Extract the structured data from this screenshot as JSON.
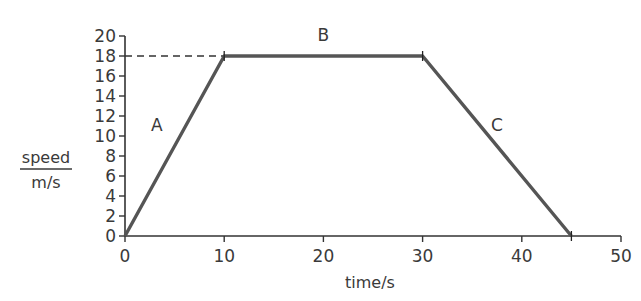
{
  "chart_data": {
    "type": "line",
    "title": "",
    "xlabel": "time/s",
    "ylabel_numerator": "speed",
    "ylabel_denominator": "m/s",
    "xlim": [
      0,
      50
    ],
    "ylim": [
      0,
      20
    ],
    "x_ticks": [
      "0",
      "10",
      "20",
      "30",
      "40",
      "50"
    ],
    "y_ticks": [
      "0",
      "2",
      "4",
      "6",
      "8",
      "10",
      "12",
      "14",
      "16",
      "18",
      "20"
    ],
    "grid": false,
    "series": [
      {
        "name": "speed",
        "x": [
          0,
          10,
          30,
          45
        ],
        "y": [
          0,
          18,
          18,
          0
        ],
        "color": "#555555"
      }
    ],
    "segment_labels": [
      {
        "label": "A",
        "x": 3.2,
        "y": 10.5
      },
      {
        "label": "B",
        "x": 20,
        "y": 19.5
      },
      {
        "label": "C",
        "x": 37.5,
        "y": 10.5
      }
    ],
    "annotations": [
      {
        "type": "dashed-line",
        "from": [
          0,
          18
        ],
        "to": [
          10,
          18
        ],
        "note": "reference to y=18"
      }
    ]
  }
}
